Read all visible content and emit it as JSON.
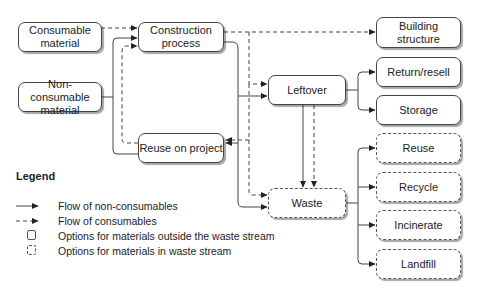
{
  "nodes": {
    "consumable": {
      "label": "Consumable\nmaterial",
      "style": "solid"
    },
    "nonconsumable": {
      "label": "Non-consumable\nmaterial",
      "style": "solid"
    },
    "construction": {
      "label": "Construction\nprocess",
      "style": "solid"
    },
    "building": {
      "label": "Building\nstructure",
      "style": "solid"
    },
    "leftover": {
      "label": "Leftover",
      "style": "solid"
    },
    "return_resell": {
      "label": "Return/resell",
      "style": "solid"
    },
    "storage": {
      "label": "Storage",
      "style": "solid"
    },
    "reuse_on_project": {
      "label": "Reuse on project",
      "style": "solid"
    },
    "waste": {
      "label": "Waste",
      "style": "dashed"
    },
    "reuse": {
      "label": "Reuse",
      "style": "dashed"
    },
    "recycle": {
      "label": "Recycle",
      "style": "dashed"
    },
    "incinerate": {
      "label": "Incinerate",
      "style": "dashed"
    },
    "landfill": {
      "label": "Landfill",
      "style": "dashed"
    }
  },
  "edges": [
    {
      "from": "consumable",
      "to": "construction",
      "type": "consumables"
    },
    {
      "from": "nonconsumable",
      "to": "construction",
      "type": "non-consumables"
    },
    {
      "from": "construction",
      "to": "building",
      "type": "consumables"
    },
    {
      "from": "construction",
      "to": "leftover",
      "type": "consumables"
    },
    {
      "from": "construction",
      "to": "leftover",
      "type": "non-consumables"
    },
    {
      "from": "construction",
      "to": "reuse_on_project",
      "type": "non-consumables"
    },
    {
      "from": "construction",
      "to": "reuse_on_project",
      "type": "consumables"
    },
    {
      "from": "construction",
      "to": "waste",
      "type": "consumables"
    },
    {
      "from": "construction",
      "to": "waste",
      "type": "non-consumables"
    },
    {
      "from": "reuse_on_project",
      "to": "construction",
      "type": "non-consumables"
    },
    {
      "from": "reuse_on_project",
      "to": "construction",
      "type": "consumables"
    },
    {
      "from": "leftover",
      "to": "return_resell",
      "type": "non-consumables"
    },
    {
      "from": "leftover",
      "to": "storage",
      "type": "non-consumables"
    },
    {
      "from": "leftover",
      "to": "waste",
      "type": "non-consumables"
    },
    {
      "from": "leftover",
      "to": "waste",
      "type": "consumables"
    },
    {
      "from": "waste",
      "to": "reuse",
      "type": "non-consumables"
    },
    {
      "from": "waste",
      "to": "recycle",
      "type": "non-consumables"
    },
    {
      "from": "waste",
      "to": "incinerate",
      "type": "non-consumables"
    },
    {
      "from": "waste",
      "to": "landfill",
      "type": "non-consumables"
    }
  ],
  "legend": {
    "title": "Legend",
    "items": [
      {
        "symbol": "solid-arrow",
        "label": "Flow of non-consumables"
      },
      {
        "symbol": "dashed-arrow",
        "label": "Flow of consumables"
      },
      {
        "symbol": "solid-box",
        "label": "Options for materials outside the waste stream"
      },
      {
        "symbol": "dashed-box",
        "label": "Options for materials in waste stream"
      }
    ]
  },
  "colors": {
    "line": "#444444",
    "dashed_line": "#555555",
    "box_fill": "#ffffff"
  }
}
